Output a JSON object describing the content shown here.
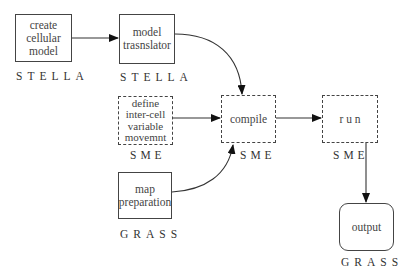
{
  "diagram": {
    "nodes": [
      {
        "id": "create",
        "label": "create cellular model",
        "lines": [
          "create",
          "cellular",
          "model"
        ],
        "tool": "STELLA",
        "style": "solid"
      },
      {
        "id": "translator",
        "label": "model trasnslator",
        "lines": [
          "model",
          "trasnslator"
        ],
        "tool": "STELLA",
        "style": "solid"
      },
      {
        "id": "define",
        "label": "define inter-cell variable movemnt",
        "lines": [
          "define",
          "inter-cell",
          "variable",
          "movemnt"
        ],
        "tool": "SME",
        "style": "dashed"
      },
      {
        "id": "map",
        "label": "map preparation",
        "lines": [
          "map",
          "preparation"
        ],
        "tool": "GRASS",
        "style": "solid"
      },
      {
        "id": "compile",
        "label": "compile",
        "lines": [
          "compile"
        ],
        "tool": "SME",
        "style": "dashed"
      },
      {
        "id": "run",
        "label": "r u n",
        "lines": [
          "r u n"
        ],
        "tool": "SME",
        "style": "dashed"
      },
      {
        "id": "output",
        "label": "output",
        "lines": [
          "output"
        ],
        "tool": "GRASS",
        "style": "rounded"
      }
    ],
    "edges": [
      {
        "from": "create",
        "to": "translator"
      },
      {
        "from": "translator",
        "to": "compile"
      },
      {
        "from": "define",
        "to": "compile"
      },
      {
        "from": "map",
        "to": "compile"
      },
      {
        "from": "compile",
        "to": "run"
      },
      {
        "from": "run",
        "to": "output"
      }
    ],
    "tools": {
      "stella": "STELLA",
      "sme": "SME",
      "grass": "GRASS"
    }
  }
}
